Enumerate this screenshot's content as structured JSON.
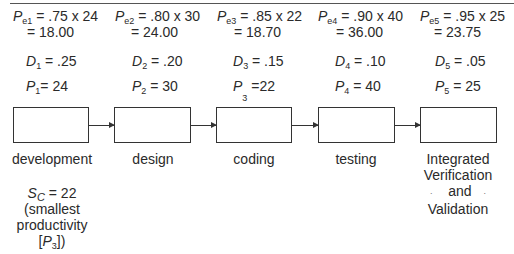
{
  "stages": [
    {
      "label": "development",
      "pe_sub": "e1",
      "pe_expr": ".75 x 24",
      "pe_result": "= 18.00",
      "d_sub": "1",
      "d_val": ".25",
      "p_sub": "1",
      "p_val": "24"
    },
    {
      "label": "design",
      "pe_sub": "e2",
      "pe_expr": ".80 x 30",
      "pe_result": "= 24.00",
      "d_sub": "2",
      "d_val": ".20",
      "p_sub": "2",
      "p_val": "30"
    },
    {
      "label": "coding",
      "pe_sub": "e3",
      "pe_expr": ".85 x 22",
      "pe_result": "= 18.70",
      "d_sub": "3",
      "d_val": ".15",
      "p_sub": "3",
      "p_val": "22"
    },
    {
      "label": "testing",
      "pe_sub": "e4",
      "pe_expr": ".90 x 40",
      "pe_result": "= 36.00",
      "d_sub": "4",
      "d_val": ".10",
      "p_sub": "4",
      "p_val": "40"
    },
    {
      "label_lines": [
        "Integrated",
        "Verification",
        "and",
        "Validation"
      ],
      "pe_sub": "e5",
      "pe_expr": ".95 x 25",
      "pe_result": "= 23.75",
      "d_sub": "5",
      "d_val": ".05",
      "p_sub": "5",
      "p_val": "25"
    }
  ],
  "symbols": {
    "P": "P",
    "D": "D",
    "S": "S",
    "eq": " = "
  },
  "summary": {
    "s_sub": "C",
    "s_val": "22",
    "line2": "(smallest",
    "line3": "productivity",
    "line4_open": "[",
    "line4_sym": "P",
    "line4_sub": "3",
    "line4_close": "])"
  }
}
